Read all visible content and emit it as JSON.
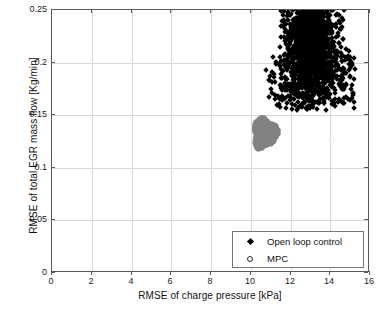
{
  "chart_data": {
    "type": "scatter",
    "title": "",
    "xlabel": "RMSE of charge pressure [kPa]",
    "ylabel": "RMSE of total EGR mass flow [Kg/min]",
    "xlim": [
      0,
      16
    ],
    "ylim": [
      0,
      0.25
    ],
    "xticks": [
      "0",
      "2",
      "4",
      "6",
      "8",
      "10",
      "12",
      "14",
      "16"
    ],
    "yticks": [
      "0",
      "0.05",
      "0.1",
      "0.15",
      "0.2",
      "0.25"
    ],
    "grid": true,
    "legend_position": "lower right",
    "series": [
      {
        "name": "Open loop control",
        "marker": "diamond",
        "color": "#000000",
        "point_count": 2000,
        "x_range": [
          10.6,
          15.2
        ],
        "y_range": [
          0.152,
          0.25
        ],
        "x_center": 12.8,
        "y_center": 0.195,
        "description": "Dense black diamond cluster, broad at bottom near 0.155 and tapering upward past 0.24"
      },
      {
        "name": "MPC",
        "marker": "circle",
        "color": "#838383",
        "point_count": 900,
        "x_range": [
          10.05,
          11.35
        ],
        "y_range": [
          0.117,
          0.149
        ],
        "x_center": 10.7,
        "y_center": 0.133,
        "description": "Compact gray circular blob well below and left of the open-loop cluster"
      }
    ]
  },
  "axes": {
    "xlabel": "RMSE of charge pressure [kPa]",
    "ylabel": "RMSE of total EGR mass flow [Kg/min]",
    "xticks": [
      "0",
      "2",
      "4",
      "6",
      "8",
      "10",
      "12",
      "14",
      "16"
    ],
    "yticks": [
      "0",
      "0.05",
      "0.1",
      "0.15",
      "0.2",
      "0.25"
    ]
  },
  "legend": {
    "entries": [
      {
        "label": "Open loop control",
        "marker": "diamond"
      },
      {
        "label": "MPC",
        "marker": "circle"
      }
    ]
  },
  "colors": {
    "open_loop": "#000000",
    "mpc": "#838383",
    "grid": "#d8d8d8",
    "axis": "#5a5a5a",
    "background": "#ffffff"
  }
}
